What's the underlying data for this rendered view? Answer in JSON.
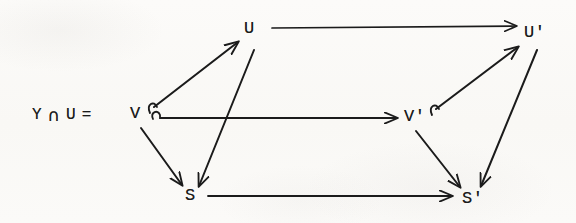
{
  "figure": {
    "kind": "commutative-diagram",
    "background_color": "#fbfaf8",
    "ink_color": "#1b1b1b",
    "width": 576,
    "height": 223
  },
  "equation_label": {
    "left_term": "Y",
    "intersection_symbol": "∩",
    "right_term": "U",
    "equals_symbol": "=",
    "result_term": "V",
    "full_text": "Y ∩ U = V"
  },
  "nodes": [
    {
      "id": "U",
      "label": "U",
      "x": 250,
      "y": 28,
      "role": "top-left-vertex"
    },
    {
      "id": "Up",
      "label": "U'",
      "x": 530,
      "y": 32,
      "role": "top-right-vertex"
    },
    {
      "id": "V",
      "label": "V",
      "x": 135,
      "y": 113,
      "role": "middle-left-vertex"
    },
    {
      "id": "Vp",
      "label": "V'",
      "x": 410,
      "y": 116,
      "role": "middle-right-vertex"
    },
    {
      "id": "S",
      "label": "S",
      "x": 190,
      "y": 195,
      "role": "bottom-left-vertex"
    },
    {
      "id": "Sp",
      "label": "S'",
      "x": 468,
      "y": 198,
      "role": "bottom-right-vertex"
    }
  ],
  "arrows": [
    {
      "id": "U-to-Up",
      "from": "U",
      "to": "Up",
      "style": "plain",
      "orientation": "horizontal"
    },
    {
      "id": "V-to-Vp",
      "from": "V",
      "to": "Vp",
      "style": "plain",
      "orientation": "horizontal"
    },
    {
      "id": "S-to-Sp",
      "from": "S",
      "to": "Sp",
      "style": "plain",
      "orientation": "horizontal"
    },
    {
      "id": "V-to-U",
      "from": "V",
      "to": "U",
      "style": "hook",
      "orientation": "diagonal-up-right"
    },
    {
      "id": "Vp-to-Up",
      "from": "Vp",
      "to": "Up",
      "style": "hook",
      "orientation": "diagonal-up-right"
    },
    {
      "id": "U-to-S",
      "from": "U",
      "to": "S",
      "style": "plain",
      "orientation": "diagonal-down-left"
    },
    {
      "id": "V-to-S",
      "from": "V",
      "to": "S",
      "style": "plain",
      "orientation": "diagonal-down-right"
    },
    {
      "id": "Up-to-Sp",
      "from": "Up",
      "to": "Sp",
      "style": "plain",
      "orientation": "diagonal-down-left"
    },
    {
      "id": "Vp-to-Sp",
      "from": "Vp",
      "to": "Sp",
      "style": "plain",
      "orientation": "diagonal-down-right"
    }
  ]
}
